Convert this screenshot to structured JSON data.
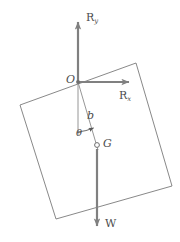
{
  "figure": {
    "type": "free-body-diagram",
    "colors": {
      "stroke_gray": "#808080",
      "outline_gray": "#7a7a7a",
      "label_gray": "#4d4d4d",
      "background": "#ffffff"
    },
    "body": {
      "name": "square-plate",
      "corners": [
        {
          "x": 20,
          "y": 105
        },
        {
          "x": 136,
          "y": 63
        },
        {
          "x": 172,
          "y": 186
        },
        {
          "x": 56,
          "y": 219
        }
      ]
    },
    "points": {
      "O": {
        "label": "O",
        "x": 78,
        "y": 82,
        "marker": "dot"
      },
      "G": {
        "label": "G",
        "x": 97,
        "y": 145,
        "marker": "open-circle"
      }
    },
    "vectors": [
      {
        "name": "reaction-y",
        "label": "R",
        "subscript": "y",
        "from": {
          "x": 78,
          "y": 82
        },
        "to": {
          "x": 78,
          "y": 18
        },
        "direction": "up"
      },
      {
        "name": "reaction-x",
        "label": "R",
        "subscript": "x",
        "from": {
          "x": 78,
          "y": 82
        },
        "to": {
          "x": 133,
          "y": 82
        },
        "direction": "right"
      },
      {
        "name": "weight",
        "label": "W",
        "subscript": "",
        "from": {
          "x": 97,
          "y": 145
        },
        "to": {
          "x": 97,
          "y": 230
        },
        "direction": "down"
      }
    ],
    "dimensions": [
      {
        "name": "moment-arm",
        "label": "b",
        "from": {
          "x": 78,
          "y": 82
        },
        "to": {
          "x": 97,
          "y": 145
        }
      }
    ],
    "angles": [
      {
        "name": "theta",
        "label": "θ",
        "vertex": {
          "x": 78,
          "y": 82
        },
        "between": [
          "vertical-down",
          "line-OG"
        ]
      }
    ]
  },
  "labels": {
    "R_y": "R",
    "R_y_sub": "y",
    "R_x": "R",
    "R_x_sub": "x",
    "O": "O",
    "G": "G",
    "b": "b",
    "theta": "θ",
    "W": "W"
  }
}
